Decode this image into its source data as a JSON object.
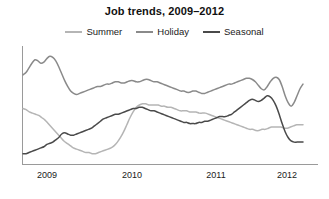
{
  "chart_data": {
    "type": "line",
    "title": "Job trends, 2009–2012",
    "xlabel": "",
    "ylabel": "",
    "grid": false,
    "legend_position": "top-center",
    "xticks": [
      "2009",
      "2010",
      "2011",
      "2012"
    ],
    "xtick_positions": [
      47,
      132,
      216,
      287
    ],
    "xlim": [
      2008.75,
      2012.25
    ],
    "ylim": [
      0,
      100
    ],
    "colors": {
      "Summer": "#b5b5b5",
      "Holiday": "#8a8a8a",
      "Seasonal": "#4a4a4a",
      "axis": "#9a9a9a",
      "text": "#1a1a1a",
      "background": "#ffffff"
    },
    "series": [
      {
        "name": "Summer",
        "color": "#b5b5b5",
        "values": [
          47,
          46,
          44,
          43,
          42,
          41,
          39,
          37,
          34,
          31,
          28,
          25,
          22,
          19,
          17,
          15,
          13,
          12,
          11,
          10,
          9,
          9,
          8,
          8,
          9,
          10,
          11,
          12,
          13,
          15,
          18,
          22,
          27,
          33,
          39,
          44,
          48,
          50,
          51,
          51,
          50,
          50,
          50,
          50,
          49,
          49,
          48,
          48,
          47,
          46,
          45,
          45,
          45,
          44,
          44,
          44,
          43,
          43,
          43,
          42,
          41,
          40,
          39,
          38,
          37,
          36,
          35,
          34,
          33,
          32,
          31,
          30,
          29,
          29,
          28,
          28,
          29,
          29,
          30,
          31,
          31,
          31,
          31,
          30,
          30,
          31,
          32,
          33,
          33,
          33
        ]
      },
      {
        "name": "Holiday",
        "color": "#8a8a8a",
        "values": [
          76,
          78,
          82,
          86,
          89,
          88,
          86,
          87,
          90,
          92,
          91,
          88,
          83,
          77,
          71,
          66,
          62,
          60,
          59,
          60,
          61,
          62,
          63,
          64,
          65,
          66,
          66,
          67,
          68,
          68,
          69,
          70,
          70,
          69,
          69,
          70,
          71,
          71,
          70,
          70,
          71,
          72,
          72,
          71,
          70,
          70,
          69,
          68,
          67,
          66,
          65,
          64,
          63,
          62,
          62,
          61,
          61,
          62,
          62,
          61,
          60,
          60,
          61,
          62,
          63,
          64,
          65,
          66,
          67,
          68,
          68,
          69,
          70,
          71,
          72,
          73,
          73,
          72,
          70,
          67,
          64,
          63,
          66,
          70,
          73,
          74,
          72,
          66,
          58,
          52,
          49,
          52,
          58,
          64,
          68
        ]
      },
      {
        "name": "Seasonal",
        "color": "#4a4a4a",
        "values": [
          8,
          8,
          9,
          10,
          11,
          12,
          13,
          14,
          16,
          17,
          18,
          20,
          22,
          25,
          26,
          25,
          24,
          24,
          25,
          26,
          27,
          28,
          29,
          30,
          32,
          34,
          36,
          38,
          39,
          40,
          41,
          42,
          42,
          43,
          44,
          45,
          46,
          47,
          47,
          48,
          48,
          47,
          46,
          45,
          45,
          44,
          43,
          42,
          41,
          40,
          39,
          38,
          37,
          36,
          35,
          35,
          34,
          34,
          34,
          35,
          35,
          36,
          36,
          37,
          38,
          39,
          40,
          40,
          40,
          41,
          42,
          44,
          46,
          48,
          50,
          52,
          54,
          55,
          54,
          53,
          54,
          56,
          58,
          57,
          54,
          49,
          42,
          34,
          27,
          22,
          19,
          18,
          18,
          18,
          18
        ]
      }
    ]
  }
}
